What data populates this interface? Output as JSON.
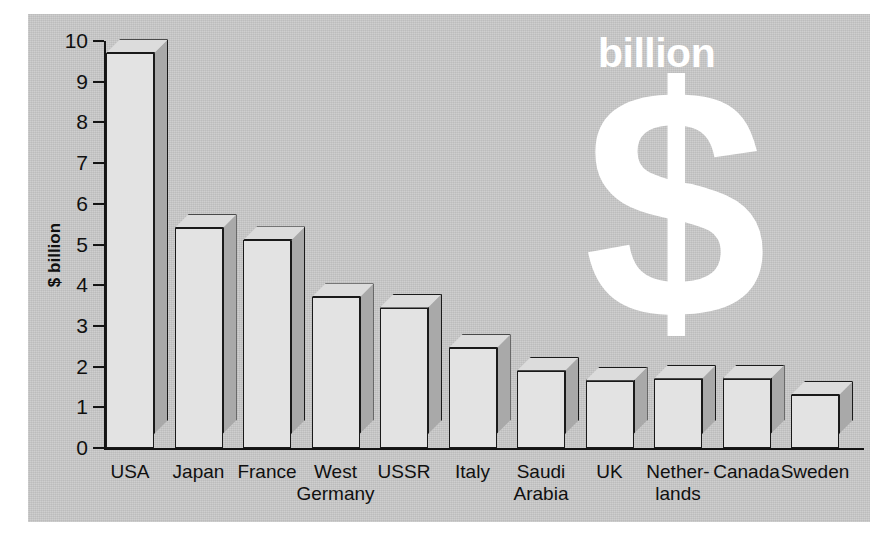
{
  "chart_data": {
    "type": "bar",
    "title": "",
    "xlabel": "",
    "ylabel": "$ billion",
    "ylim": [
      0,
      10
    ],
    "ytick_labels": [
      "10",
      "9",
      "8",
      "7",
      "6",
      "5",
      "4",
      "3",
      "2",
      "1",
      "0"
    ],
    "yticks": [
      10,
      9,
      8,
      7,
      6,
      5,
      4,
      3,
      2,
      1,
      0
    ],
    "grid": false,
    "legend": "none",
    "style": "3d-bars",
    "categories": [
      "USA",
      "Japan",
      "France",
      "West\nGermany",
      "USSR",
      "Italy",
      "Saudi\nArabia",
      "UK",
      "Nether-\nlands",
      "Canada",
      "Sweden"
    ],
    "values": [
      9.7,
      5.4,
      5.1,
      3.7,
      3.45,
      2.45,
      1.9,
      1.65,
      1.7,
      1.7,
      1.3
    ],
    "annotations": {
      "watermark_text": "billion",
      "watermark_symbol": "$"
    }
  },
  "colors": {
    "panel_background": "#c9c9c9",
    "page_background": "#ffffff",
    "bar_front": "#e3e3e3",
    "bar_side": "#a9a9a9",
    "bar_top": "#dcdcdc",
    "outline": "#1a1a1a",
    "text": "#101010",
    "watermark": "#ffffff"
  }
}
